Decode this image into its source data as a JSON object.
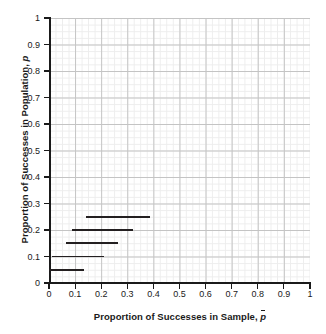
{
  "chart_data": {
    "type": "line",
    "title": "",
    "xlabel": "Proportion of Successes in Sample, p̄",
    "ylabel": "Proportion of Successes in Population, p",
    "xlabel_parts": {
      "text": "Proportion of Successes in Sample, ",
      "symbol": "p",
      "symbol_style": "overbar-italic"
    },
    "ylabel_parts": {
      "text": "Proportion of Successes in Population, ",
      "symbol": "p",
      "symbol_style": "italic"
    },
    "xlim": [
      0,
      1
    ],
    "ylim": [
      0,
      1
    ],
    "grid": true,
    "grid_major_step": 0.1,
    "grid_minor_step": 0.025,
    "legend": "none",
    "xticks": [
      "0",
      "0.1",
      "0.2",
      "0.3",
      "0.4",
      "0.5",
      "0.6",
      "0.7",
      "0.8",
      "0.9",
      "1"
    ],
    "xtick_values": [
      0,
      0.1,
      0.2,
      0.3,
      0.4,
      0.5,
      0.6,
      0.7,
      0.8,
      0.9,
      1
    ],
    "yticks": [
      "0",
      "0.1",
      "0.2",
      "0.3",
      "0.4",
      "0.5",
      "0.6",
      "0.7",
      "0.8",
      "0.9",
      "1"
    ],
    "ytick_values": [
      0,
      0.1,
      0.2,
      0.3,
      0.4,
      0.5,
      0.6,
      0.7,
      0.8,
      0.9,
      1
    ],
    "series_description": "Horizontal confidence-interval segments: each segment is drawn at a population proportion p and spans a range of sample proportions p-bar.",
    "intervals": [
      {
        "p": 0.25,
        "x_start": 0.142,
        "x_end": 0.387,
        "color": "#231f20"
      },
      {
        "p": 0.2,
        "x_start": 0.088,
        "x_end": 0.322,
        "color": "#231f20"
      },
      {
        "p": 0.15,
        "x_start": 0.065,
        "x_end": 0.264,
        "color": "#231f20"
      },
      {
        "p": 0.1,
        "x_start": 0.011,
        "x_end": 0.211,
        "color": "#231f20"
      },
      {
        "p": 0.05,
        "x_start": 0.0,
        "x_end": 0.134,
        "color": "#231f20"
      }
    ]
  },
  "colors": {
    "axis": "#1a1a1a",
    "grid_major": "#c4c4c4",
    "grid_minor": "#ededed",
    "data": "#231f20",
    "background": "#ffffff"
  }
}
